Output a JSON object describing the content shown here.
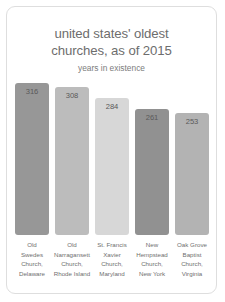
{
  "card": {
    "background": "#ffffff",
    "border_color": "#dedede"
  },
  "chart_data": {
    "type": "bar",
    "title": "united states' oldest\nchurches, as of 2015",
    "subtitle": "years in existence",
    "xlabel": "",
    "ylabel": "years in existence",
    "ylim": [
      0,
      316
    ],
    "grid": false,
    "legend": "none",
    "categories": [
      "Old\nSwedes\nChurch,\nDelaware",
      "Old\nNarragansett\nChurch,\nRhode Island",
      "St. Francis\nXavier\nChurch,\nMaryland",
      "New\nHempstead\nChurch,\nNew York",
      "Oak Grove\nBaptist\nChurch,\nVirginia"
    ],
    "values": [
      316,
      308,
      284,
      261,
      253
    ],
    "value_labels": [
      "316",
      "308",
      "284",
      "261",
      "253"
    ],
    "bar_colors": [
      "#979797",
      "#bcbcbc",
      "#d7d7d7",
      "#919191",
      "#b3b3b3"
    ],
    "label_color": "#5a5a5a"
  }
}
